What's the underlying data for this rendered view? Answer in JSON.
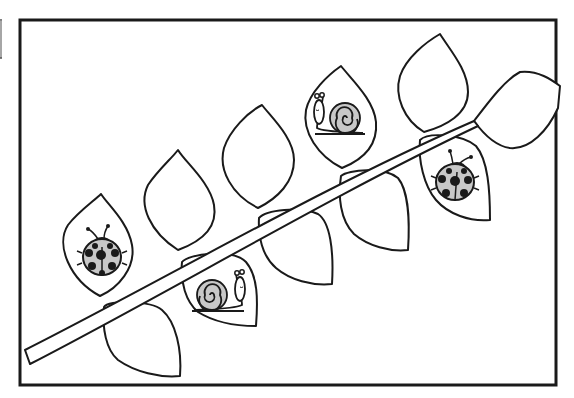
{
  "image": {
    "description": "Black-and-white coloring page: a diagonal branch with leaves, two ladybugs and two snails inside leaves",
    "subjects": [
      "branch",
      "leaves",
      "ladybug",
      "ladybug",
      "snail",
      "snail"
    ]
  },
  "colors": {
    "line": "#1a1a1a",
    "paper": "#ffffff",
    "shell_gray": "#c8c8c8",
    "spot": "#1a1a1a"
  },
  "frame": {
    "x": 20,
    "y": 20,
    "width": 536,
    "height": 365
  }
}
